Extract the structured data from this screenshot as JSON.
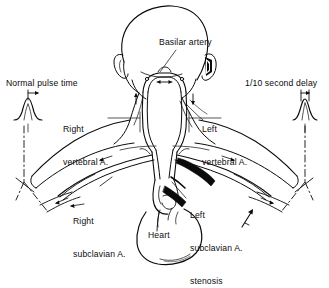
{
  "figure": {
    "view": "posterior",
    "background_color": "#ffffff",
    "ink_color": "#0b0b0b",
    "style": "black-and-white line drawing"
  },
  "labels": {
    "normal_pulse_time": "Normal pulse time",
    "delay": "1/10 second delay",
    "basilar_artery": "Basilar artery",
    "right_vertebral_line1": "Right",
    "right_vertebral_line2": "vertebral A.",
    "left_vertebral_line1": "Left",
    "left_vertebral_line2": "vertebral A.",
    "right_subclavian_line1": "Right",
    "right_subclavian_line2": "subclavian A.",
    "left_subclavian_line1": "Left",
    "left_subclavian_line2": "subclavian A.",
    "left_subclavian_line3": "stenosis",
    "heart": "Heart"
  },
  "waveforms": [
    {
      "name": "normal-pulse-waveform",
      "side": "left",
      "caption": "Normal pulse time",
      "marker": "double-headed-arrow",
      "description": "single sharp symmetric peak with timing arrow above"
    },
    {
      "name": "delayed-pulse-waveform",
      "side": "right",
      "caption": "1/10 second delay",
      "marker": "double-headed-arrow",
      "description": "narrow shifted peak indicating one tenth second delay"
    }
  ],
  "anatomy": [
    {
      "name": "head",
      "note": "bald posterior cranium"
    },
    {
      "name": "left-ear",
      "note": "ear pinna, viewer left"
    },
    {
      "name": "right-ear",
      "note": "ear pinna, viewer right"
    },
    {
      "name": "neck",
      "note": "posterior neck with trapezius borders"
    },
    {
      "name": "basilar-artery",
      "note": "arch at base of skull joining both vertebral arteries"
    },
    {
      "name": "right-vertebral-artery",
      "note": "ascends in neck, viewer left"
    },
    {
      "name": "left-vertebral-artery",
      "note": "ascends in neck, viewer right, reversed flow"
    },
    {
      "name": "right-subclavian-artery",
      "note": "patent, runs to right arm"
    },
    {
      "name": "left-subclavian-artery",
      "note": "stenosed segment shown filled black"
    },
    {
      "name": "aortic-arch",
      "note": "arch giving rise to great vessels"
    },
    {
      "name": "heart",
      "note": "rounded cardiac silhouette"
    },
    {
      "name": "left-shoulder-arm",
      "note": "viewer left shoulder and upper arm"
    },
    {
      "name": "right-shoulder-arm",
      "note": "viewer right shoulder and upper arm"
    }
  ],
  "flow_arrows": [
    {
      "name": "basilar-flow-arrow",
      "direction": "toward-midline"
    },
    {
      "name": "right-vertebral-up-arrow",
      "direction": "cranial"
    },
    {
      "name": "left-vertebral-down-arrow",
      "direction": "caudal-reversed"
    },
    {
      "name": "right-subclavian-flow-arrow",
      "direction": "lateral"
    },
    {
      "name": "left-subclavian-flow-arrow",
      "direction": "lateral"
    },
    {
      "name": "stenosis-pointer-arrow",
      "direction": "toward-stenosis"
    }
  ],
  "leader_lines": [
    {
      "name": "basilar-leader",
      "from": "Basilar artery",
      "to": "basilar-artery"
    },
    {
      "name": "right-vertebral-leader",
      "from": "Right vertebral A.",
      "to": "right-vertebral-artery"
    },
    {
      "name": "left-vertebral-leader",
      "from": "Left vertebral A.",
      "to": "left-vertebral-artery"
    },
    {
      "name": "right-subclavian-leader",
      "from": "Right subclavian A.",
      "to": "right-subclavian-artery"
    },
    {
      "name": "left-subclavian-leader",
      "from": "Left subclavian A. stenosis",
      "to": "stenosis"
    }
  ],
  "measure_lines": [
    {
      "name": "left-measure-line",
      "style": "dash-dot",
      "connects": "normal-pulse-waveform to right arm pulse point"
    },
    {
      "name": "right-measure-line",
      "style": "dash-dot",
      "connects": "delayed-pulse-waveform to left arm pulse point"
    }
  ]
}
